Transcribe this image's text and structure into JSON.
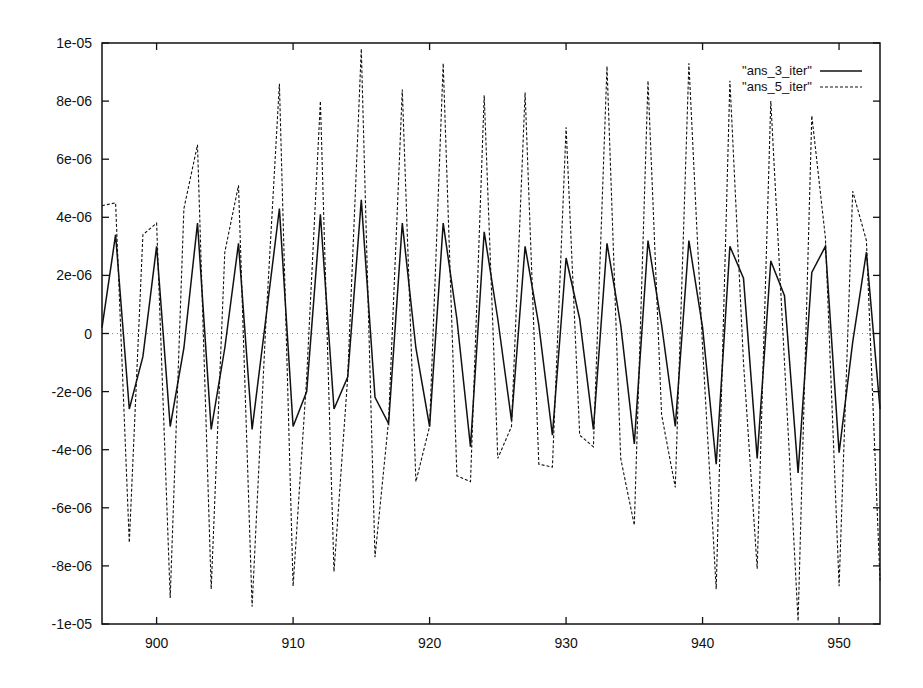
{
  "chart_data": {
    "type": "line",
    "title": "",
    "xlabel": "",
    "ylabel": "",
    "xlim": [
      896,
      953
    ],
    "ylim": [
      -1e-05,
      1e-05
    ],
    "grid": false,
    "legend_position": "top-right",
    "x_ticks": [
      900,
      910,
      920,
      930,
      940,
      950
    ],
    "x_tick_labels": [
      "900",
      "910",
      "920",
      "930",
      "940",
      "950"
    ],
    "y_ticks": [
      1e-05,
      8e-06,
      6e-06,
      4e-06,
      2e-06,
      0,
      -2e-06,
      -4e-06,
      -6e-06,
      -8e-06,
      -1e-05
    ],
    "y_tick_labels": [
      "1e-05",
      "8e-06",
      "6e-06",
      "4e-06",
      "2e-06",
      "0",
      "-2e-06",
      "-4e-06",
      "-6e-06",
      "-8e-06",
      "-1e-05"
    ],
    "zero_line": "dotted",
    "x": [
      896,
      897,
      898,
      899,
      900,
      901,
      902,
      903,
      904,
      905,
      906,
      907,
      908,
      909,
      910,
      911,
      912,
      913,
      914,
      915,
      916,
      917,
      918,
      919,
      920,
      921,
      922,
      923,
      924,
      925,
      926,
      927,
      928,
      929,
      930,
      931,
      932,
      933,
      934,
      935,
      936,
      937,
      938,
      939,
      940,
      941,
      942,
      943,
      944,
      945,
      946,
      947,
      948,
      949,
      950,
      951,
      952,
      953
    ],
    "value_unit": "1e-06",
    "series": [
      {
        "name": "\"ans_3_iter\"",
        "style": "solid",
        "values": [
          0.2,
          3.4,
          -2.6,
          -0.8,
          3.0,
          -3.2,
          -0.5,
          3.8,
          -3.3,
          -0.5,
          3.1,
          -3.3,
          0.5,
          4.3,
          -3.2,
          -2.0,
          4.1,
          -2.6,
          -1.5,
          4.6,
          -2.2,
          -3.1,
          3.8,
          -0.5,
          -3.2,
          3.8,
          0.5,
          -3.9,
          3.5,
          0.5,
          -3.0,
          3.0,
          0.3,
          -3.5,
          2.6,
          0.5,
          -3.3,
          3.1,
          0.3,
          -3.8,
          3.2,
          0.3,
          -3.2,
          3.2,
          0.2,
          -4.5,
          3.0,
          1.9,
          -4.3,
          2.5,
          1.3,
          -4.8,
          2.1,
          3.0,
          -4.1,
          -0.3,
          2.8,
          -2.6
        ]
      },
      {
        "name": "\"ans_5_iter\"",
        "style": "dashed",
        "values": [
          4.4,
          4.5,
          -7.2,
          3.4,
          3.8,
          -9.1,
          4.3,
          6.5,
          -8.8,
          2.8,
          5.1,
          -9.4,
          0.3,
          8.6,
          -8.7,
          -1.5,
          8.0,
          -8.2,
          -1.5,
          9.8,
          -7.7,
          -3.0,
          8.4,
          -5.1,
          -3.2,
          9.3,
          -4.9,
          -5.1,
          8.2,
          -4.3,
          -3.2,
          8.3,
          -4.5,
          -4.6,
          7.1,
          -3.5,
          -3.9,
          9.2,
          -4.3,
          -6.6,
          8.7,
          -2.8,
          -5.3,
          9.3,
          -0.5,
          -8.8,
          8.7,
          -1.0,
          -8.1,
          8.0,
          -1.0,
          -9.9,
          7.5,
          3.3,
          -8.7,
          4.9,
          3.2,
          -8.5
        ]
      }
    ]
  },
  "legend": {
    "items": [
      {
        "label": "\"ans_3_iter\"",
        "style": "solid"
      },
      {
        "label": "\"ans_5_iter\"",
        "style": "dashed"
      }
    ]
  },
  "colors": {
    "line": "#111111",
    "axis": "#111111",
    "zero_line": "#888888"
  }
}
